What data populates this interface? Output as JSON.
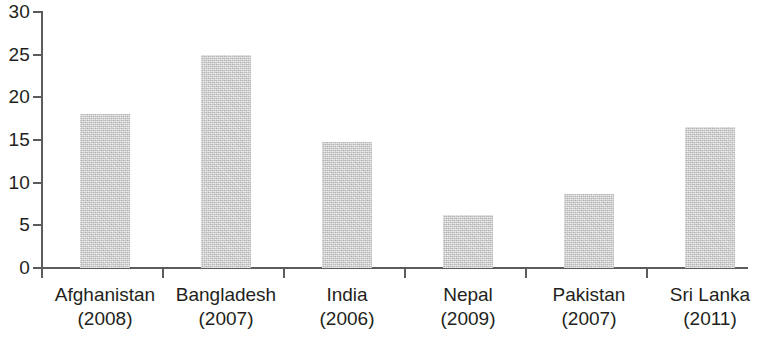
{
  "chart_data": {
    "type": "bar",
    "title": "",
    "subtitle": "",
    "xlabel": "",
    "ylabel": "",
    "categories": [
      "Afghanistan",
      "Bangladesh",
      "India",
      "Nepal",
      "Pakistan",
      "Sri Lanka"
    ],
    "category_years": [
      "(2008)",
      "(2007)",
      "(2006)",
      "(2009)",
      "(2007)",
      "(2011)"
    ],
    "values": [
      18.1,
      25.0,
      14.8,
      6.2,
      8.7,
      16.5
    ],
    "ylim": [
      0,
      30
    ],
    "ytick_labels": [
      "0",
      "5",
      "10",
      "15",
      "20",
      "25",
      "30"
    ],
    "ytick_values": [
      0,
      5,
      10,
      15,
      20,
      25,
      30
    ],
    "grid": false,
    "legend": false,
    "legend_position": "none",
    "bar_color": "#cdcdcd",
    "axis_color": "#5c5c5c",
    "text_color": "#231f20",
    "background_color": "#ffffff"
  }
}
